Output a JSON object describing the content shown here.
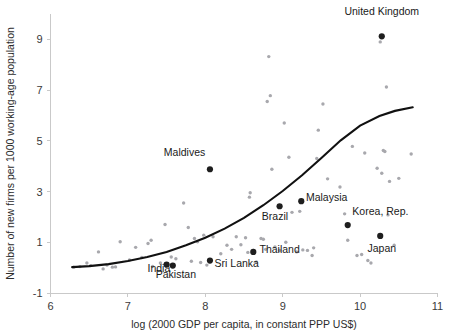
{
  "chart_data": {
    "type": "scatter",
    "title": "",
    "xlabel": "log (2000 GDP per capita, in constant PPP US$)",
    "ylabel": "Number of new firms per 1000 working-age population",
    "xlim": [
      6,
      11
    ],
    "ylim": [
      -1,
      10
    ],
    "xticks": [
      6,
      7,
      8,
      9,
      10,
      11
    ],
    "yticks": [
      -1,
      1,
      3,
      5,
      7,
      9
    ],
    "grid": false,
    "legend": "none",
    "series": [
      {
        "name": "Countries (unlabeled)",
        "marker": "small-grey-dot",
        "points": [
          [
            6.3,
            0.02
          ],
          [
            6.38,
            0.04
          ],
          [
            6.47,
            0.18
          ],
          [
            6.52,
            0.08
          ],
          [
            6.62,
            0.62
          ],
          [
            6.68,
            -0.05
          ],
          [
            6.73,
            0.1
          ],
          [
            6.8,
            0.02
          ],
          [
            6.84,
            0.03
          ],
          [
            6.9,
            1.02
          ],
          [
            7.02,
            0.3
          ],
          [
            7.1,
            0.8
          ],
          [
            7.18,
            0.4
          ],
          [
            7.26,
            0.95
          ],
          [
            7.3,
            1.08
          ],
          [
            7.32,
            0.05
          ],
          [
            7.42,
            0.18
          ],
          [
            7.48,
            1.7
          ],
          [
            7.56,
            0.42
          ],
          [
            7.62,
            0.35
          ],
          [
            7.72,
            2.55
          ],
          [
            7.78,
            1.58
          ],
          [
            7.82,
            0.25
          ],
          [
            7.86,
            1.15
          ],
          [
            7.9,
            1.02
          ],
          [
            7.94,
            0.2
          ],
          [
            7.98,
            1.28
          ],
          [
            8.02,
            0.1
          ],
          [
            8.1,
            1.22
          ],
          [
            8.2,
            0.55
          ],
          [
            8.28,
            0.88
          ],
          [
            8.34,
            0.72
          ],
          [
            8.4,
            1.22
          ],
          [
            8.46,
            0.9
          ],
          [
            8.52,
            1.18
          ],
          [
            8.55,
            0.6
          ],
          [
            8.57,
            2.78
          ],
          [
            8.58,
            2.95
          ],
          [
            8.62,
            0.68
          ],
          [
            8.66,
            0.22
          ],
          [
            8.72,
            1.15
          ],
          [
            8.75,
            1.12
          ],
          [
            8.78,
            0.72
          ],
          [
            8.8,
            6.55
          ],
          [
            8.82,
            8.32
          ],
          [
            8.84,
            6.78
          ],
          [
            8.86,
            3.88
          ],
          [
            8.9,
            0.82
          ],
          [
            8.96,
            0.68
          ],
          [
            9.02,
            5.7
          ],
          [
            9.04,
            1.0
          ],
          [
            9.08,
            4.35
          ],
          [
            9.12,
            2.18
          ],
          [
            9.18,
            0.62
          ],
          [
            9.22,
            2.22
          ],
          [
            9.26,
            0.7
          ],
          [
            9.32,
            0.68
          ],
          [
            9.38,
            0.48
          ],
          [
            9.4,
            0.78
          ],
          [
            9.44,
            4.3
          ],
          [
            9.46,
            5.42
          ],
          [
            9.52,
            6.45
          ],
          [
            9.58,
            3.5
          ],
          [
            9.74,
            3.18
          ],
          [
            9.8,
            2.12
          ],
          [
            9.84,
            1.08
          ],
          [
            9.9,
            4.78
          ],
          [
            9.96,
            0.48
          ],
          [
            10.02,
            0.52
          ],
          [
            10.06,
            4.52
          ],
          [
            10.1,
            0.28
          ],
          [
            10.14,
            0.18
          ],
          [
            10.22,
            3.92
          ],
          [
            10.26,
            8.9
          ],
          [
            10.28,
            3.72
          ],
          [
            10.3,
            4.62
          ],
          [
            10.32,
            4.58
          ],
          [
            10.34,
            7.12
          ],
          [
            10.36,
            2.08
          ],
          [
            10.38,
            3.4
          ],
          [
            10.44,
            0.88
          ],
          [
            10.5,
            3.52
          ],
          [
            10.66,
            4.48
          ]
        ]
      },
      {
        "name": "Highlighted countries",
        "marker": "large-black-dot",
        "points": [
          {
            "country": "India",
            "x": 7.5,
            "y": 0.12
          },
          {
            "country": "Pakistan",
            "x": 7.58,
            "y": 0.08
          },
          {
            "country": "Sri Lanka",
            "x": 8.06,
            "y": 0.28
          },
          {
            "country": "Maldives",
            "x": 8.06,
            "y": 3.88
          },
          {
            "country": "Thailand",
            "x": 8.62,
            "y": 0.62
          },
          {
            "country": "Brazil",
            "x": 8.96,
            "y": 2.42
          },
          {
            "country": "Malaysia",
            "x": 9.24,
            "y": 2.62
          },
          {
            "country": "Korea, Rep.",
            "x": 9.84,
            "y": 1.68
          },
          {
            "country": "Japan",
            "x": 10.26,
            "y": 1.25
          },
          {
            "country": "United Kingdom",
            "x": 10.28,
            "y": 9.12
          }
        ]
      }
    ],
    "fit_curve": {
      "name": "Fitted exponential trend",
      "x_start": 6.28,
      "x_end": 10.68,
      "points": [
        [
          6.28,
          0.02
        ],
        [
          6.5,
          0.06
        ],
        [
          6.75,
          0.14
        ],
        [
          7.0,
          0.26
        ],
        [
          7.25,
          0.42
        ],
        [
          7.5,
          0.62
        ],
        [
          7.75,
          0.88
        ],
        [
          8.0,
          1.18
        ],
        [
          8.25,
          1.54
        ],
        [
          8.5,
          1.96
        ],
        [
          8.75,
          2.46
        ],
        [
          9.0,
          3.02
        ],
        [
          9.25,
          3.64
        ],
        [
          9.5,
          4.32
        ],
        [
          9.75,
          5.02
        ],
        [
          10.0,
          5.6
        ],
        [
          10.25,
          5.98
        ],
        [
          10.45,
          6.18
        ],
        [
          10.68,
          6.32
        ]
      ]
    },
    "annotations": [
      {
        "text": "United Kingdom",
        "anchor": "middle",
        "x": 10.28,
        "y": 9.95
      },
      {
        "text": "Maldives",
        "anchor": "end",
        "x": 8.0,
        "y": 4.42
      },
      {
        "text": "Malaysia",
        "anchor": "start",
        "x": 9.3,
        "y": 2.62
      },
      {
        "text": "Brazil",
        "anchor": "middle",
        "x": 8.9,
        "y": 1.86
      },
      {
        "text": "Korea, Rep.",
        "anchor": "start",
        "x": 9.9,
        "y": 2.08
      },
      {
        "text": "Japan",
        "anchor": "middle",
        "x": 10.28,
        "y": 0.62
      },
      {
        "text": "Thailand",
        "anchor": "start",
        "x": 8.7,
        "y": 0.56
      },
      {
        "text": "Sri Lanka",
        "anchor": "start",
        "x": 8.12,
        "y": 0.02
      },
      {
        "text": "India",
        "anchor": "middle",
        "x": 7.4,
        "y": -0.18
      },
      {
        "text": "Pakistan",
        "anchor": "middle",
        "x": 7.62,
        "y": -0.42
      }
    ],
    "colors": {
      "faint_point": "#a8a8ad",
      "bold_point": "#1e1e1e",
      "curve": "#111111",
      "axis": "#c9c9c9",
      "text": "#1a1a1a"
    }
  }
}
